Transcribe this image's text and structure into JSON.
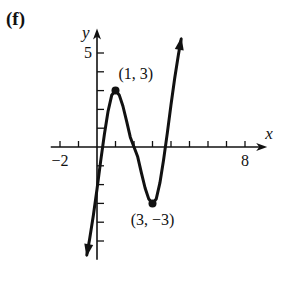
{
  "panel": {
    "label": "(f)"
  },
  "chart_data": {
    "type": "line",
    "title": "",
    "xlabel": "x",
    "ylabel": "y",
    "xlim": [
      -2.5,
      9.2
    ],
    "ylim": [
      -6,
      6.3
    ],
    "x_tick_step": 1,
    "y_tick_step": 1,
    "x_tick_labels": [
      {
        "value": -2,
        "text": "−2"
      },
      {
        "value": 8,
        "text": "8"
      }
    ],
    "y_tick_labels": [
      {
        "value": 5,
        "text": "5"
      }
    ],
    "grid": false,
    "legend": null,
    "series": [
      {
        "name": "cubic curve",
        "description": "Cubic with local max at (1,3) and local min at (3,-3); arrows at both ends",
        "x": [
          -0.55,
          -0.4,
          -0.2,
          0,
          0.2,
          0.4,
          0.6,
          0.8,
          1,
          1.2,
          1.4,
          1.6,
          1.8,
          2,
          2.2,
          2.4,
          2.6,
          2.8,
          3,
          3.2,
          3.4,
          3.6,
          3.8,
          4,
          4.2,
          4.4,
          4.55
        ],
        "y": [
          -5.75,
          -4.91,
          -3.66,
          -2.25,
          -0.74,
          0.68,
          1.91,
          2.77,
          3.0,
          2.77,
          2.18,
          1.37,
          0.52,
          0,
          -0.52,
          -1.37,
          -2.18,
          -2.77,
          -3.0,
          -2.77,
          -1.91,
          -0.68,
          0.74,
          2.25,
          3.66,
          4.91,
          5.75
        ]
      }
    ],
    "annotations": [
      {
        "x": 1,
        "y": 3,
        "text": "(1, 3)",
        "marker": "dot"
      },
      {
        "x": 3,
        "y": -3,
        "text": "(3, −3)",
        "marker": "dot"
      }
    ]
  },
  "axes": {
    "x_label": "x",
    "y_label": "y"
  }
}
